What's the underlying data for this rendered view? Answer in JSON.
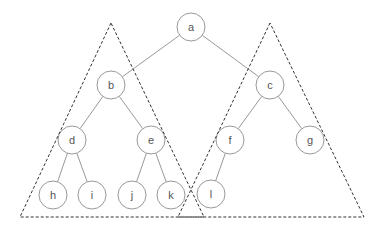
{
  "diagram": {
    "type": "binary-tree-with-subtree-triangles",
    "colors": {
      "edge": "#999999",
      "node_stroke": "#999999",
      "node_fill": "#ffffff",
      "label": "#555555",
      "triangle": "#333333"
    },
    "node_radius": 14,
    "nodes": [
      {
        "id": "a",
        "label": "a",
        "x": 191,
        "y": 27
      },
      {
        "id": "b",
        "label": "b",
        "x": 111,
        "y": 85
      },
      {
        "id": "c",
        "label": "c",
        "x": 270,
        "y": 85
      },
      {
        "id": "d",
        "label": "d",
        "x": 72,
        "y": 140
      },
      {
        "id": "e",
        "label": "e",
        "x": 151,
        "y": 140
      },
      {
        "id": "f",
        "label": "f",
        "x": 230,
        "y": 140
      },
      {
        "id": "g",
        "label": "g",
        "x": 310,
        "y": 140
      },
      {
        "id": "h",
        "label": "h",
        "x": 53,
        "y": 195
      },
      {
        "id": "i",
        "label": "i",
        "x": 92,
        "y": 195
      },
      {
        "id": "j",
        "label": "j",
        "x": 132,
        "y": 195
      },
      {
        "id": "k",
        "label": "k",
        "x": 171,
        "y": 195
      },
      {
        "id": "l",
        "label": "l",
        "x": 211,
        "y": 194
      }
    ],
    "edges": [
      [
        "a",
        "b"
      ],
      [
        "a",
        "c"
      ],
      [
        "b",
        "d"
      ],
      [
        "b",
        "e"
      ],
      [
        "c",
        "f"
      ],
      [
        "c",
        "g"
      ],
      [
        "d",
        "h"
      ],
      [
        "d",
        "i"
      ],
      [
        "e",
        "j"
      ],
      [
        "e",
        "k"
      ],
      [
        "f",
        "l"
      ]
    ],
    "triangles": [
      {
        "id": "left-subtree",
        "points": [
          [
            111,
            23
          ],
          [
            20,
            217
          ],
          [
            204,
            217
          ]
        ]
      },
      {
        "id": "right-subtree",
        "points": [
          [
            270,
            23
          ],
          [
            178,
            217
          ],
          [
            364,
            217
          ]
        ]
      }
    ]
  }
}
